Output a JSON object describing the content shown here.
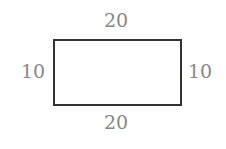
{
  "diagram": {
    "shape": "rectangle",
    "labels": {
      "top": "20",
      "bottom": "20",
      "left": "10",
      "right": "10"
    },
    "colors": {
      "stroke": "#333333",
      "label": "#888888"
    }
  }
}
